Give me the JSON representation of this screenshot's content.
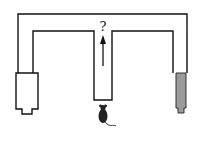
{
  "diagram": {
    "type": "T-maze",
    "choice_label": "?",
    "colors": {
      "line": "#111111",
      "left_goal_fill": "#ffffff",
      "right_goal_fill": "#9a9a9a",
      "mouse": "#222222"
    }
  }
}
